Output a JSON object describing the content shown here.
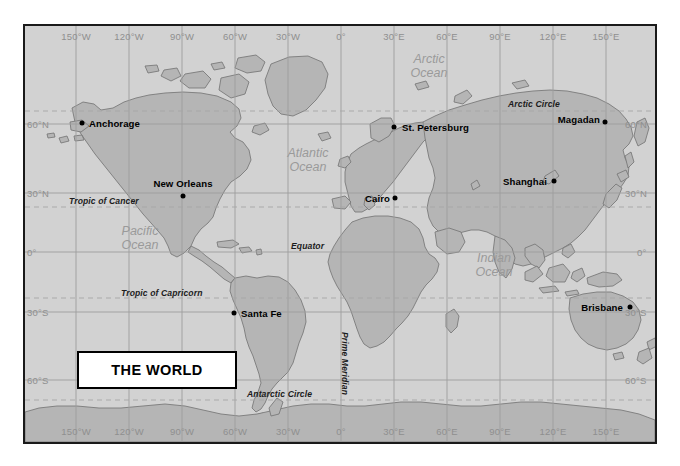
{
  "map": {
    "title": "THE WORLD",
    "background_color": "#d2d2d2",
    "land_color": "#b4b4b4",
    "graticule_color": "#9a9a9a",
    "frame_color": "#1a1a1a",
    "projection_note": "cylindrical equidistant",
    "longitude_labels": [
      {
        "label": "150°W",
        "value": -150
      },
      {
        "label": "120°W",
        "value": -120
      },
      {
        "label": "90°W",
        "value": -90
      },
      {
        "label": "60°W",
        "value": -60
      },
      {
        "label": "30°W",
        "value": -30
      },
      {
        "label": "0°",
        "value": 0
      },
      {
        "label": "30°E",
        "value": 30
      },
      {
        "label": "60°E",
        "value": 60
      },
      {
        "label": "90°E",
        "value": 90
      },
      {
        "label": "120°E",
        "value": 120
      },
      {
        "label": "150°E",
        "value": 150
      }
    ],
    "latitude_labels": [
      {
        "label": "60°N",
        "value": 60
      },
      {
        "label": "30°N",
        "value": 30
      },
      {
        "label": "0°",
        "value": 0
      },
      {
        "label": "30°S",
        "value": -30
      },
      {
        "label": "60°S",
        "value": -60
      }
    ],
    "reference_lines": [
      {
        "name": "Arctic Circle",
        "label": "Arctic Circle",
        "latitude": 66.5,
        "style": "dashed"
      },
      {
        "name": "Tropic of Cancer",
        "label": "Tropic of Cancer",
        "latitude": 23.5,
        "style": "dashed"
      },
      {
        "name": "Equator",
        "label": "Equator",
        "latitude": 0,
        "style": "solid"
      },
      {
        "name": "Tropic of Capricorn",
        "label": "Tropic of Capricorn",
        "latitude": -23.5,
        "style": "dashed"
      },
      {
        "name": "Antarctic Circle",
        "label": "Antarctic Circle",
        "latitude": -66.5,
        "style": "dashed"
      },
      {
        "name": "Prime Meridian",
        "label": "Prime Meridian",
        "longitude": 0,
        "style": "solid"
      }
    ],
    "oceans": [
      {
        "label": "Arctic Ocean",
        "lines": [
          "Arctic",
          "Ocean"
        ]
      },
      {
        "label": "Atlantic Ocean",
        "lines": [
          "Atlantic",
          "Ocean"
        ]
      },
      {
        "label": "Pacific Ocean",
        "lines": [
          "Pacific",
          "Ocean"
        ]
      },
      {
        "label": "Indian Ocean",
        "lines": [
          "Indian",
          "Ocean"
        ]
      }
    ],
    "cities": [
      {
        "name": "Anchorage",
        "label_side": "right"
      },
      {
        "name": "New Orleans",
        "label_side": "above"
      },
      {
        "name": "Santa Fe",
        "label_side": "right"
      },
      {
        "name": "St. Petersburg",
        "label_side": "right"
      },
      {
        "name": "Cairo",
        "label_side": "left"
      },
      {
        "name": "Magadan",
        "label_side": "left"
      },
      {
        "name": "Shanghai",
        "label_side": "left"
      },
      {
        "name": "Brisbane",
        "label_side": "left"
      }
    ]
  }
}
